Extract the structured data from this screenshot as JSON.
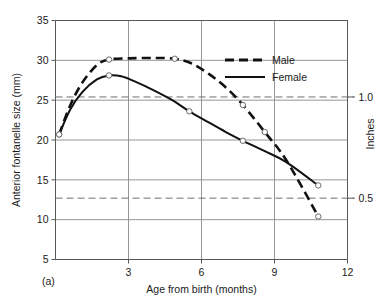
{
  "chart_data": {
    "type": "line",
    "title": "",
    "panel_label": "(a)",
    "xlabel": "Age from birth (months)",
    "ylabel": "Anterior fontanelle size (mm)",
    "y2label": "Inches",
    "xlim": [
      0,
      12
    ],
    "ylim": [
      5,
      35
    ],
    "y2lim": [
      0.1968,
      1.3779
    ],
    "grid": true,
    "legend_position": "upper right",
    "xticks": [
      3,
      6,
      9,
      12
    ],
    "xtick_labels": [
      "3",
      "6",
      "9",
      "12"
    ],
    "yticks": [
      5,
      10,
      15,
      20,
      25,
      30,
      35
    ],
    "ytick_labels": [
      "5",
      "10",
      "15",
      "20",
      "25",
      "30",
      "35"
    ],
    "y2ticks": [
      0.5,
      1.0
    ],
    "y2tick_labels": [
      "0.5",
      "1.0"
    ],
    "reference_lines": [
      {
        "label": "1.0",
        "value_mm": 25.4,
        "style": "dashed"
      },
      {
        "label": "0.5",
        "value_mm": 12.7,
        "style": "dashed"
      }
    ],
    "series": [
      {
        "name": "Male",
        "style": "dashed",
        "points": [
          {
            "x": 0.15,
            "y": 20.7
          },
          {
            "x": 0.6,
            "y": 24.3
          },
          {
            "x": 1.1,
            "y": 27.2
          },
          {
            "x": 1.7,
            "y": 29.4
          },
          {
            "x": 2.2,
            "y": 30.1
          },
          {
            "x": 3.0,
            "y": 30.25
          },
          {
            "x": 4.0,
            "y": 30.3
          },
          {
            "x": 4.9,
            "y": 30.2
          },
          {
            "x": 5.6,
            "y": 29.6
          },
          {
            "x": 6.3,
            "y": 28.3
          },
          {
            "x": 7.0,
            "y": 26.6
          },
          {
            "x": 7.7,
            "y": 24.4
          },
          {
            "x": 8.6,
            "y": 21.0
          },
          {
            "x": 9.5,
            "y": 17.4
          },
          {
            "x": 10.8,
            "y": 10.4
          }
        ],
        "markers": [
          {
            "x": 0.15,
            "y": 20.7
          },
          {
            "x": 2.2,
            "y": 30.1
          },
          {
            "x": 4.9,
            "y": 30.2
          },
          {
            "x": 7.7,
            "y": 24.4
          },
          {
            "x": 8.6,
            "y": 21.0
          },
          {
            "x": 10.8,
            "y": 10.4
          }
        ]
      },
      {
        "name": "Female",
        "style": "solid",
        "points": [
          {
            "x": 0.15,
            "y": 20.7
          },
          {
            "x": 0.6,
            "y": 23.8
          },
          {
            "x": 1.1,
            "y": 26.0
          },
          {
            "x": 1.7,
            "y": 27.6
          },
          {
            "x": 2.2,
            "y": 28.1
          },
          {
            "x": 2.7,
            "y": 28.0
          },
          {
            "x": 3.3,
            "y": 27.3
          },
          {
            "x": 4.0,
            "y": 26.3
          },
          {
            "x": 4.8,
            "y": 25.0
          },
          {
            "x": 5.5,
            "y": 23.6
          },
          {
            "x": 6.3,
            "y": 22.2
          },
          {
            "x": 7.0,
            "y": 21.0
          },
          {
            "x": 7.7,
            "y": 19.9
          },
          {
            "x": 8.6,
            "y": 18.6
          },
          {
            "x": 9.5,
            "y": 17.2
          },
          {
            "x": 10.8,
            "y": 14.3
          }
        ],
        "markers": [
          {
            "x": 0.15,
            "y": 20.7
          },
          {
            "x": 2.2,
            "y": 28.1
          },
          {
            "x": 5.5,
            "y": 23.6
          },
          {
            "x": 7.7,
            "y": 19.9
          },
          {
            "x": 10.8,
            "y": 14.3
          }
        ]
      }
    ],
    "legend": [
      {
        "label": "Male",
        "style": "dashed"
      },
      {
        "label": "Female",
        "style": "solid"
      }
    ]
  }
}
